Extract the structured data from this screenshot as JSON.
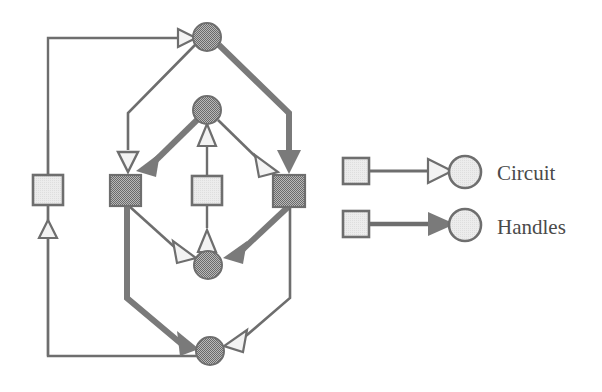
{
  "diagram": {
    "type": "petri-net",
    "colors": {
      "stroke": "#6e6e6e",
      "dark_fill": "#8c8c8c",
      "light_fill": "#e2e2e2",
      "text": "#4a4a4a",
      "background": "#ffffff"
    },
    "nodes": [
      {
        "id": "p-top",
        "kind": "place",
        "shape": "circle",
        "fill": "dark",
        "cx": 207,
        "cy": 37,
        "r": 14
      },
      {
        "id": "p-upper-mid",
        "kind": "place",
        "shape": "circle",
        "fill": "dark",
        "cx": 207,
        "cy": 110,
        "r": 14
      },
      {
        "id": "p-lower-mid",
        "kind": "place",
        "shape": "circle",
        "fill": "dark",
        "cx": 208,
        "cy": 265,
        "r": 14
      },
      {
        "id": "p-bottom",
        "kind": "place",
        "shape": "circle",
        "fill": "dark",
        "cx": 210,
        "cy": 351,
        "r": 14
      },
      {
        "id": "t-left-outer",
        "kind": "transition",
        "shape": "square",
        "fill": "light",
        "x": 33,
        "y": 175,
        "w": 30,
        "h": 30
      },
      {
        "id": "t-left-inner",
        "kind": "transition",
        "shape": "square",
        "fill": "dark",
        "x": 110,
        "y": 175,
        "w": 31,
        "h": 31
      },
      {
        "id": "t-center",
        "kind": "transition",
        "shape": "square",
        "fill": "light",
        "x": 192,
        "y": 176,
        "w": 30,
        "h": 29
      },
      {
        "id": "t-right-inner",
        "kind": "transition",
        "shape": "square",
        "fill": "dark",
        "x": 273,
        "y": 175,
        "w": 32,
        "h": 32
      }
    ],
    "edges": [
      {
        "id": "e-feedback-loop",
        "from": "p-bottom",
        "to": "p-top",
        "style": "circuit",
        "note": "outer left feedback path bottom to top"
      },
      {
        "id": "e-loop-to-left-outer",
        "from": "p-bottom",
        "to": "t-left-outer",
        "style": "circuit",
        "note": "upward into far left square"
      },
      {
        "id": "e-top-to-leftinner",
        "from": "p-top",
        "to": "t-left-inner",
        "style": "circuit"
      },
      {
        "id": "e-top-to-rightinner",
        "from": "p-top",
        "to": "t-right-inner",
        "style": "handles"
      },
      {
        "id": "e-uppermid-to-left",
        "from": "p-upper-mid",
        "to": "t-left-inner",
        "style": "handles"
      },
      {
        "id": "e-uppermid-to-right",
        "from": "p-upper-mid",
        "to": "t-right-inner",
        "style": "circuit"
      },
      {
        "id": "e-center-to-uppermid",
        "from": "t-center",
        "to": "p-upper-mid",
        "style": "circuit"
      },
      {
        "id": "e-leftinner-to-lower",
        "from": "t-left-inner",
        "to": "p-lower-mid",
        "style": "circuit"
      },
      {
        "id": "e-rightinner-to-lower",
        "from": "t-right-inner",
        "to": "p-lower-mid",
        "style": "handles"
      },
      {
        "id": "e-center-to-lowermid",
        "from": "t-center",
        "to": "p-lower-mid",
        "style": "circuit"
      },
      {
        "id": "e-leftinner-to-bot",
        "from": "t-left-inner",
        "to": "p-bottom",
        "style": "handles"
      },
      {
        "id": "e-rightinner-to-bot",
        "from": "t-right-inner",
        "to": "p-bottom",
        "style": "circuit"
      }
    ]
  },
  "legend": {
    "entries": [
      {
        "id": "legend-circuit",
        "label": "Circuit",
        "arrowhead": "hollow",
        "line": "thin",
        "square": {
          "x": 343,
          "y": 158,
          "w": 26,
          "h": 26
        },
        "circle": {
          "cx": 465,
          "cy": 172,
          "r": 16
        },
        "text_x": 497,
        "text_y": 180
      },
      {
        "id": "legend-handles",
        "label": "Handles",
        "arrowhead": "filled",
        "line": "thick",
        "square": {
          "x": 343,
          "y": 211,
          "w": 26,
          "h": 26
        },
        "circle": {
          "cx": 465,
          "cy": 225,
          "r": 16
        },
        "text_x": 497,
        "text_y": 234
      }
    ]
  }
}
